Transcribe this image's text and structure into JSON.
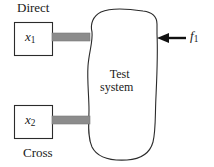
{
  "figure": {
    "background_color": "#ffffff",
    "line_color": "#2b2b2b",
    "connector_color": "#8c8c8c",
    "labels": {
      "direct": "Direct",
      "cross": "Cross",
      "test_system_line1": "Test",
      "test_system_line2": "system"
    },
    "response_boxes": [
      {
        "id": "x1",
        "symbol": "x",
        "subscript": "1",
        "group": "Direct"
      },
      {
        "id": "x2",
        "symbol": "x",
        "subscript": "2",
        "group": "Cross"
      }
    ],
    "excitation": {
      "symbol": "f",
      "subscript": "1",
      "arrow_direction": "left",
      "arrow_color": "#111111"
    }
  }
}
